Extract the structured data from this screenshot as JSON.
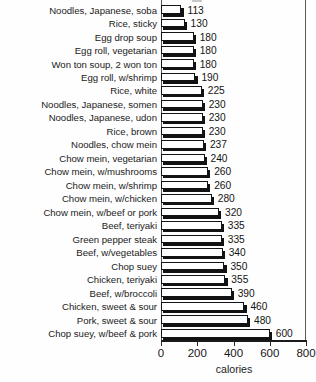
{
  "chart_data": {
    "type": "bar",
    "orientation": "horizontal",
    "title": "",
    "xlabel": "calories",
    "ylabel": "",
    "xlim": [
      0,
      800
    ],
    "xticks": [
      0,
      200,
      400,
      600,
      800
    ],
    "xtick_labels": [
      "0",
      "200",
      "400",
      "600",
      "800"
    ],
    "grid": false,
    "legend": null,
    "bar_style": "white-fill-black-outline-with-drop-shadow",
    "categories": [
      "Noodles, Japanese, soba",
      "Rice, sticky",
      "Egg drop soup",
      "Egg roll, vegetarian",
      "Won ton soup, 2 won ton",
      "Egg roll, w/shrimp",
      "Rice, white",
      "Noodles, Japanese, somen",
      "Noodles, Japanese, udon",
      "Rice, brown",
      "Noodles, chow mein",
      "Chow mein, vegetarian",
      "Chow mein, w/mushrooms",
      "Chow mein, w/shrimp",
      "Chow mein, w/chicken",
      "Chow mein, w/beef or pork",
      "Beef, teriyaki",
      "Green pepper steak",
      "Beef, w/vegetables",
      "Chop suey",
      "Chicken, teriyaki",
      "Beef, w/broccoli",
      "Chicken, sweet & sour",
      "Pork, sweet & sour",
      "Chop suey, w/beef & pork"
    ],
    "values": [
      113,
      130,
      180,
      180,
      180,
      190,
      225,
      230,
      230,
      230,
      237,
      240,
      260,
      260,
      280,
      320,
      335,
      335,
      340,
      350,
      355,
      390,
      460,
      480,
      600
    ],
    "value_labels": [
      "113",
      "130",
      "180",
      "180",
      "180",
      "190",
      "225",
      "230",
      "230",
      "230",
      "237",
      "240",
      "260",
      "260",
      "280",
      "320",
      "335",
      "335",
      "340",
      "350",
      "355",
      "390",
      "460",
      "480",
      "600"
    ]
  },
  "axis": {
    "x_title": "calories"
  },
  "colors": {
    "bar_face": "#ffffff",
    "bar_outline": "#141414",
    "bar_shadow": "#121212",
    "text": "#1b1b1b",
    "frame": "#5a5a5a",
    "background": "#fefefe"
  }
}
